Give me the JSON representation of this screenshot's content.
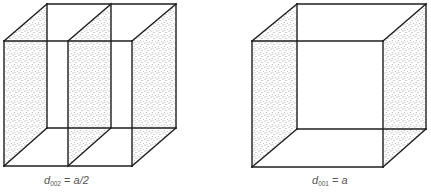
{
  "figure": {
    "panels": [
      {
        "id": "left",
        "description": "Cubic unit cell with two shaded (002) planes: left and right faces plus a middle plane",
        "label": {
          "symbol": "d",
          "subscript": "002",
          "equals": "=",
          "value": "a/2"
        },
        "shaded_planes": [
          "left-face",
          "middle-plane",
          "right-face"
        ]
      },
      {
        "id": "right",
        "description": "Cubic unit cell with shaded (001) planes: left and right faces only",
        "label": {
          "symbol": "d",
          "subscript": "001",
          "equals": "=",
          "value": "a"
        },
        "shaded_planes": [
          "left-face",
          "right-face"
        ]
      }
    ],
    "colors": {
      "edge": "#1e1e1e",
      "stipple": "#3a3a3a",
      "background": "#ffffff",
      "label": "#555555"
    }
  }
}
